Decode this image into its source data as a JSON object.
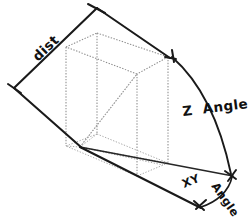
{
  "diagram": {
    "style": {
      "background": "#ffffff",
      "line_color": "#1a1a1a",
      "wireframe_color": "#8c8c8c",
      "text_color": "#111111"
    },
    "labels": {
      "dist": "dist",
      "z_angle": "Z  Angle",
      "xy_angle_part1": "XY",
      "xy_angle_part2": "Angle"
    },
    "annotations": [
      {
        "name": "dist",
        "text": "dist",
        "type": "dimension-line",
        "from": [
          14,
          88
        ],
        "to": [
          97,
          8
        ],
        "rotation_deg": -44
      },
      {
        "name": "z-angle",
        "text": "Z  Angle",
        "type": "arc-with-arrow",
        "arc_start": [
          172,
          57
        ],
        "arc_end": [
          232,
          176
        ],
        "rotation_deg": -6
      },
      {
        "name": "xy-angle",
        "text": "XY Angle",
        "type": "arc-with-arrow",
        "arc_start": [
          232,
          176
        ],
        "arc_end": [
          200,
          207
        ],
        "rotation_xy_deg": -22,
        "rotation_angle_deg": 58
      }
    ],
    "geometry": {
      "origin": [
        80,
        147
      ],
      "z_axis_end": [
        97,
        8
      ],
      "xy_axis_end": [
        232,
        176
      ],
      "ground_line_end": [
        200,
        207
      ],
      "box": {
        "type": "wireframe-cuboid",
        "style": "dotted",
        "front_bottom": [
          80,
          147
        ],
        "top_near": [
          97,
          33
        ],
        "right_bottom": [
          163,
          165
        ],
        "right_top": [
          168,
          57
        ]
      }
    }
  }
}
